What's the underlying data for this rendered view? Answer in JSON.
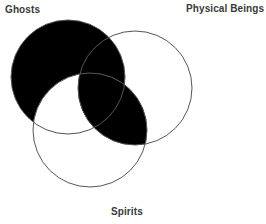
{
  "figure": {
    "type": "venn-diagram",
    "set_count": 3,
    "background_color": "#ffffff",
    "outline_color": "#555555",
    "fill_color": "#000000",
    "outline_width": 1,
    "width": 266,
    "height": 224
  },
  "labels": {
    "ghosts": "Ghosts",
    "physical_beings": "Physical Beings",
    "spirits": "Spirits"
  },
  "circles": [
    {
      "id": "ghosts",
      "label": "Ghosts",
      "cx": 68,
      "cy": 77,
      "r": 57,
      "fill": "#000000",
      "stroke": "#555555",
      "label_position": "top-left"
    },
    {
      "id": "physical_beings",
      "label": "Physical Beings",
      "cx": 135,
      "cy": 88,
      "r": 57,
      "fill": "#ffffff",
      "stroke": "#555555",
      "label_position": "top-right"
    },
    {
      "id": "spirits",
      "label": "Spirits",
      "cx": 90,
      "cy": 130,
      "r": 57,
      "fill": "#ffffff",
      "stroke": "#555555",
      "label_position": "bottom-center"
    }
  ],
  "regions": [
    {
      "id": "ghosts-only",
      "sets": [
        "ghosts"
      ],
      "shaded": true
    },
    {
      "id": "ghosts-physical-only",
      "sets": [
        "ghosts",
        "physical_beings"
      ],
      "shaded": true
    },
    {
      "id": "ghosts-spirits-only",
      "sets": [
        "ghosts",
        "spirits"
      ],
      "shaded": false
    },
    {
      "id": "ghosts-physical-spirits",
      "sets": [
        "ghosts",
        "physical_beings",
        "spirits"
      ],
      "shaded": true
    },
    {
      "id": "physical-only",
      "sets": [
        "physical_beings"
      ],
      "shaded": false
    },
    {
      "id": "physical-spirits-only",
      "sets": [
        "physical_beings",
        "spirits"
      ],
      "shaded": true
    },
    {
      "id": "spirits-only",
      "sets": [
        "spirits"
      ],
      "shaded": false
    }
  ]
}
